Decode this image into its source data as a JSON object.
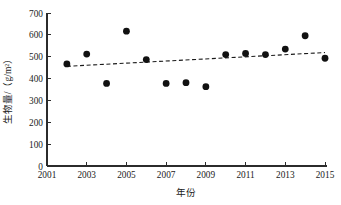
{
  "chart_data": {
    "type": "scatter",
    "title": "",
    "xlabel": "年份",
    "ylabel": "生物量/（g/m²）",
    "xlim": [
      2001,
      2015
    ],
    "ylim": [
      0,
      700
    ],
    "xticks": [
      2001,
      2003,
      2005,
      2007,
      2009,
      2011,
      2013,
      2015
    ],
    "xtick_labels": [
      "2001",
      "2003",
      "2005",
      "2007",
      "2009",
      "2011",
      "2013",
      "2015"
    ],
    "xminorticks": [
      2002,
      2004,
      2006,
      2008,
      2010,
      2012,
      2014
    ],
    "yticks": [
      0,
      100,
      200,
      300,
      400,
      500,
      600,
      700
    ],
    "ytick_labels": [
      "0",
      "100",
      "200",
      "300",
      "400",
      "500",
      "600",
      "700"
    ],
    "grid": false,
    "legend": null,
    "marker": "filled-circle",
    "marker_color": "#111111",
    "x": [
      2002,
      2003,
      2004,
      2005,
      2006,
      2007,
      2008,
      2009,
      2010,
      2011,
      2012,
      2013,
      2014,
      2015
    ],
    "values": [
      467,
      512,
      378,
      617,
      487,
      378,
      381,
      363,
      510,
      515,
      510,
      535,
      596,
      493
    ],
    "series": [
      {
        "name": "生物量",
        "x": [
          2002,
          2003,
          2004,
          2005,
          2006,
          2007,
          2008,
          2009,
          2010,
          2011,
          2012,
          2013,
          2014,
          2015
        ],
        "values": [
          467,
          512,
          378,
          617,
          487,
          378,
          381,
          363,
          510,
          515,
          510,
          535,
          596,
          493
        ]
      }
    ],
    "trendline": {
      "style": "dashed",
      "color": "#1a1a1a",
      "x_start": 2002,
      "y_start": 456,
      "x_end": 2015,
      "y_end": 519
    }
  },
  "figure": {
    "background_color": "#ffffff",
    "axis_color": "#2b2b2b"
  }
}
